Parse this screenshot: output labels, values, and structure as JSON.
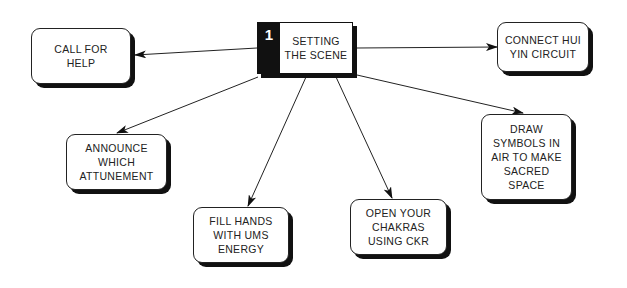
{
  "diagram": {
    "center": {
      "number": "1",
      "title": "SETTING\nTHE SCENE"
    },
    "nodes": [
      {
        "id": "call-for-help",
        "label": "CALL FOR\nHELP"
      },
      {
        "id": "connect-hui-yin-circuit",
        "label": "CONNECT HUI\nYIN CIRCUIT"
      },
      {
        "id": "announce-which-attunement",
        "label": "ANNOUNCE\nWHICH\nATTUNEMENT"
      },
      {
        "id": "fill-hands-with-ums-energy",
        "label": "FILL HANDS\nWITH UMS\nENERGY"
      },
      {
        "id": "open-your-chakras-using-ckr",
        "label": "OPEN YOUR\nCHAKRAS\nUSING CKR"
      },
      {
        "id": "draw-symbols-in-air",
        "label": "DRAW\nSYMBOLS IN\nAIR TO MAKE\nSACRED\nSPACE"
      }
    ],
    "colors": {
      "line": "#222222",
      "box_border": "#222222",
      "shadow": "#111111",
      "number_bg": "#111111",
      "number_fg": "#ffffff",
      "background": "#ffffff"
    }
  }
}
